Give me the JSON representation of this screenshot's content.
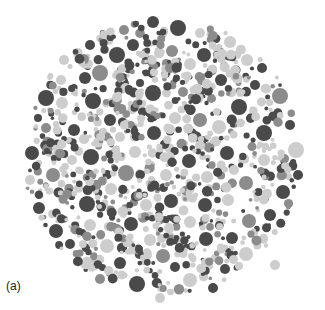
{
  "figure": {
    "label": "(a)",
    "plate": {
      "cx": 163,
      "cy": 156,
      "r": 141
    },
    "colors": {
      "dark": "#4a4a4a",
      "mid": "#8c8c8c",
      "light": "#cdcdcd",
      "background": "#ffffff"
    },
    "dots": [
      [
        153,
        22,
        6,
        "dark"
      ],
      [
        140,
        24,
        7,
        "light"
      ],
      [
        178,
        28,
        8,
        "dark"
      ],
      [
        124,
        30,
        5,
        "mid"
      ],
      [
        200,
        33,
        5,
        "light"
      ],
      [
        172,
        51,
        6,
        "mid"
      ],
      [
        117,
        55,
        8,
        "dark"
      ],
      [
        90,
        45,
        5,
        "dark"
      ],
      [
        100,
        73,
        8,
        "mid"
      ],
      [
        140,
        83,
        4,
        "dark"
      ],
      [
        230,
        42,
        6,
        "light"
      ],
      [
        85,
        78,
        6,
        "dark"
      ],
      [
        46,
        98,
        8,
        "dark"
      ],
      [
        61,
        80,
        5,
        "light"
      ],
      [
        204,
        55,
        7,
        "dark"
      ],
      [
        247,
        60,
        6,
        "light"
      ],
      [
        262,
        68,
        5,
        "dark"
      ],
      [
        153,
        93,
        8,
        "dark"
      ],
      [
        183,
        92,
        5,
        "mid"
      ],
      [
        280,
        96,
        8,
        "mid"
      ],
      [
        239,
        107,
        8,
        "dark"
      ],
      [
        93,
        101,
        8,
        "dark"
      ],
      [
        200,
        120,
        7,
        "mid"
      ],
      [
        264,
        133,
        8,
        "dark"
      ],
      [
        296,
        150,
        8,
        "light"
      ],
      [
        32,
        153,
        7,
        "dark"
      ],
      [
        53,
        175,
        7,
        "mid"
      ],
      [
        91,
        157,
        8,
        "dark"
      ],
      [
        126,
        173,
        8,
        "mid"
      ],
      [
        154,
        133,
        7,
        "dark"
      ],
      [
        189,
        161,
        7,
        "dark"
      ],
      [
        227,
        153,
        7,
        "dark"
      ],
      [
        246,
        183,
        7,
        "mid"
      ],
      [
        283,
        192,
        7,
        "dark"
      ],
      [
        39,
        208,
        6,
        "dark"
      ],
      [
        87,
        204,
        8,
        "dark"
      ],
      [
        171,
        201,
        7,
        "dark"
      ],
      [
        205,
        205,
        7,
        "dark"
      ],
      [
        56,
        231,
        7,
        "dark"
      ],
      [
        131,
        224,
        7,
        "dark"
      ],
      [
        249,
        221,
        7,
        "mid"
      ],
      [
        107,
        246,
        7,
        "light"
      ],
      [
        163,
        256,
        7,
        "mid"
      ],
      [
        206,
        239,
        7,
        "dark"
      ],
      [
        246,
        254,
        7,
        "light"
      ],
      [
        70,
        244,
        5,
        "dark"
      ],
      [
        137,
        284,
        8,
        "dark"
      ],
      [
        190,
        280,
        7,
        "light"
      ],
      [
        225,
        269,
        5,
        "dark"
      ],
      [
        275,
        265,
        5,
        "light"
      ],
      [
        62,
        103,
        6,
        "light"
      ],
      [
        120,
        137,
        5,
        "light"
      ],
      [
        175,
        118,
        6,
        "light"
      ],
      [
        219,
        127,
        7,
        "light"
      ],
      [
        110,
        120,
        6,
        "dark"
      ],
      [
        74,
        130,
        6,
        "dark"
      ],
      [
        46,
        128,
        5,
        "mid"
      ],
      [
        135,
        152,
        6,
        "light"
      ],
      [
        166,
        175,
        6,
        "light"
      ],
      [
        207,
        177,
        6,
        "light"
      ],
      [
        264,
        160,
        6,
        "light"
      ],
      [
        252,
        110,
        5,
        "light"
      ],
      [
        111,
        189,
        6,
        "light"
      ],
      [
        146,
        205,
        6,
        "light"
      ],
      [
        228,
        200,
        6,
        "light"
      ],
      [
        270,
        215,
        6,
        "dark"
      ],
      [
        90,
        225,
        6,
        "light"
      ],
      [
        150,
        240,
        6,
        "light"
      ],
      [
        190,
        222,
        6,
        "light"
      ],
      [
        232,
        238,
        6,
        "dark"
      ],
      [
        120,
        263,
        6,
        "dark"
      ],
      [
        175,
        267,
        5,
        "dark"
      ],
      [
        213,
        288,
        5,
        "dark"
      ],
      [
        160,
        298,
        5,
        "light"
      ],
      [
        100,
        279,
        5,
        "mid"
      ],
      [
        298,
        175,
        5,
        "dark"
      ],
      [
        290,
        125,
        5,
        "dark"
      ],
      [
        30,
        180,
        5,
        "light"
      ],
      [
        64,
        60,
        5,
        "light"
      ],
      [
        133,
        45,
        6,
        "dark"
      ],
      [
        190,
        64,
        6,
        "light"
      ],
      [
        221,
        80,
        6,
        "dark"
      ],
      [
        255,
        85,
        5,
        "dark"
      ],
      [
        72,
        160,
        5,
        "light"
      ],
      [
        38,
        118,
        4,
        "dark"
      ]
    ],
    "filler": {
      "count": 900,
      "seed": 7,
      "min_r": 1.8,
      "max_r": 5.2,
      "weights": {
        "dark": 0.34,
        "mid": 0.22,
        "light": 0.44
      }
    }
  }
}
